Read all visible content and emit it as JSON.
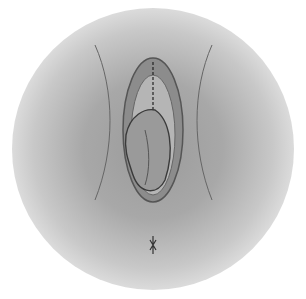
{
  "illustration": {
    "style": "grayscale circular vignette",
    "colors": {
      "background": "#ffffff",
      "mid": "#a8a8a8",
      "dark": "#4a4a4a"
    }
  }
}
